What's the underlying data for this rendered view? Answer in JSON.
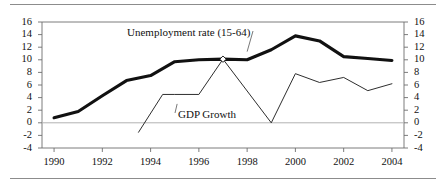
{
  "chart_data": {
    "type": "line",
    "title": "",
    "subtitle": "",
    "xlabel": "",
    "ylabel": "",
    "xlim": [
      1989.5,
      2004.5
    ],
    "ylim": [
      -4,
      16
    ],
    "y_ticks": [
      16,
      14,
      12,
      10,
      8,
      6,
      4,
      2,
      0,
      -2,
      -4
    ],
    "y_tick_labels": [
      "16",
      "14",
      "12",
      "10",
      "8",
      "6",
      "4",
      "2",
      "0",
      "-2",
      "-4"
    ],
    "y_axis_right_labels": [
      "16",
      "14",
      "12",
      "10",
      "8",
      "6",
      "4",
      "2",
      "0",
      "-2",
      "-4"
    ],
    "x_ticks": [
      1990,
      1992,
      1994,
      1996,
      1998,
      2000,
      2002,
      2004
    ],
    "x_tick_labels": [
      "1990",
      "1992",
      "1994",
      "1996",
      "1998",
      "2000",
      "2002",
      "2004"
    ],
    "grid": false,
    "zero_line": true,
    "legend_position": "inline-annotation",
    "series": [
      {
        "name": "Unemployment rate (15-64)",
        "style": "thick",
        "color": "#111111",
        "x": [
          1990,
          1991,
          1992,
          1993,
          1994,
          1995,
          1996,
          1997,
          1998,
          1999,
          2000,
          2001,
          2002,
          2003,
          2004
        ],
        "values": [
          0.8,
          1.8,
          4.3,
          6.7,
          7.5,
          9.7,
          10.0,
          10.1,
          10.0,
          11.6,
          13.8,
          13.0,
          10.5,
          10.2,
          9.9
        ]
      },
      {
        "name": "GDP Growth",
        "style": "thin",
        "color": "#222222",
        "x": [
          1993.5,
          1994.5,
          1995,
          1996,
          1997,
          1999,
          2000,
          2001,
          2002,
          2003,
          2004
        ],
        "values": [
          -1.5,
          4.5,
          4.5,
          4.5,
          10.1,
          0.0,
          7.8,
          6.4,
          7.2,
          5.1,
          6.2
        ]
      }
    ],
    "annotations": [
      {
        "name": "unemployment-label",
        "text": "Unemployment rate (15-64)",
        "leader_line": true,
        "anchor_x": 1998.0,
        "anchor_y": 11.3
      },
      {
        "name": "gdp-label",
        "text": "GDP Growth",
        "leader_line": true,
        "anchor_x": 1995.1,
        "anchor_y": 3.0
      }
    ],
    "markers": [
      {
        "name": "crossing-marker",
        "x": 1997,
        "y": 10.1,
        "shape": "diamond"
      }
    ]
  },
  "axes": {
    "left_label_0": "16",
    "left_label_1": "14",
    "left_label_2": "12",
    "left_label_3": "10",
    "left_label_4": "8",
    "left_label_5": "6",
    "left_label_6": "4",
    "left_label_7": "2",
    "left_label_8": "0",
    "left_label_9": "-2",
    "left_label_10": "-4"
  },
  "colors": {
    "frame": "#6e6e6e",
    "zero_line": "#b3b3b3",
    "series_primary": "#111111",
    "series_secondary": "#222222",
    "rule": "#8c8c8c",
    "background": "#ffffff"
  }
}
